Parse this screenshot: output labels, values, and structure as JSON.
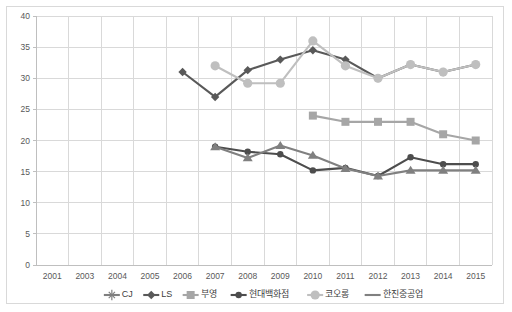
{
  "chart_data": {
    "type": "line",
    "title": "",
    "xlabel": "",
    "ylabel": "",
    "ylim": [
      0,
      40
    ],
    "ytick_step": 5,
    "grid": true,
    "legend_position": "bottom",
    "categories": [
      "2001",
      "2003",
      "2004",
      "2005",
      "2006",
      "2007",
      "2008",
      "2009",
      "2010",
      "2011",
      "2012",
      "2013",
      "2014",
      "2015"
    ],
    "yticks": [
      "0",
      "5",
      "10",
      "15",
      "20",
      "25",
      "30",
      "35",
      "40"
    ],
    "series": [
      {
        "name": "CJ",
        "color": "#7f7f7f",
        "marker": "star",
        "values": [
          null,
          null,
          null,
          null,
          null,
          null,
          null,
          null,
          null,
          null,
          null,
          null,
          null,
          null
        ]
      },
      {
        "name": "LS",
        "color": "#595959",
        "marker": "diamond",
        "values": [
          null,
          null,
          null,
          null,
          31,
          27,
          31.3,
          33,
          34.5,
          33,
          30,
          32.2,
          31,
          32.2
        ]
      },
      {
        "name": "부영",
        "color": "#a6a6a6",
        "marker": "square",
        "values": [
          null,
          null,
          null,
          null,
          null,
          null,
          null,
          null,
          24,
          23,
          23,
          23,
          21,
          20
        ]
      },
      {
        "name": "현대백화점",
        "color": "#4d4d4d",
        "marker": "circle-small",
        "values": [
          null,
          null,
          null,
          null,
          null,
          19,
          18.2,
          17.8,
          15.2,
          15.6,
          14.3,
          17.3,
          16.2,
          16.2
        ]
      },
      {
        "name": "코오롱",
        "color": "#bfbfbf",
        "marker": "circle",
        "values": [
          null,
          null,
          null,
          null,
          null,
          32,
          29.2,
          29.2,
          36,
          32,
          30,
          32.2,
          31,
          32.2
        ]
      },
      {
        "name": "한진중공업",
        "color": "#808080",
        "marker": "triangle",
        "values": [
          null,
          null,
          null,
          null,
          null,
          19,
          17.2,
          19.2,
          17.6,
          15.5,
          14.3,
          15.2,
          15.2,
          15.2
        ]
      }
    ],
    "legend": [
      {
        "label": "CJ",
        "color": "#7f7f7f",
        "marker": "star"
      },
      {
        "label": "LS",
        "color": "#595959",
        "marker": "diamond"
      },
      {
        "label": "부영",
        "color": "#a6a6a6",
        "marker": "square"
      },
      {
        "label": "현대백화점",
        "color": "#4d4d4d",
        "marker": "circle-small"
      },
      {
        "label": "코오롱",
        "color": "#bfbfbf",
        "marker": "circle"
      },
      {
        "label": "한진중공업",
        "color": "#808080",
        "marker": "line"
      }
    ]
  }
}
